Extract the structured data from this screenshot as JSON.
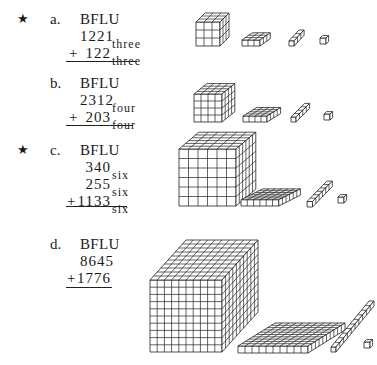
{
  "problems": [
    {
      "id": "a",
      "starred": true,
      "label": "a.",
      "title": "BFLU",
      "lines": [
        {
          "op": "",
          "value": "1221",
          "base": "three"
        },
        {
          "op": "+",
          "value": "122",
          "base": "three"
        }
      ],
      "blocks": {
        "base": 3
      }
    },
    {
      "id": "b",
      "starred": false,
      "label": "b.",
      "title": "BFLU",
      "lines": [
        {
          "op": "",
          "value": "2312",
          "base": "four"
        },
        {
          "op": "+",
          "value": "203",
          "base": "four"
        }
      ],
      "blocks": {
        "base": 4
      }
    },
    {
      "id": "c",
      "starred": true,
      "label": "c.",
      "title": "BFLU",
      "lines": [
        {
          "op": "",
          "value": "340",
          "base": "six"
        },
        {
          "op": "",
          "value": "255",
          "base": "six"
        },
        {
          "op": "+",
          "value": "1133",
          "base": "six"
        }
      ],
      "blocks": {
        "base": 6
      }
    },
    {
      "id": "d",
      "starred": false,
      "label": "d.",
      "title": "BFLU",
      "lines": [
        {
          "op": "",
          "value": "8645",
          "base": ""
        },
        {
          "op": "+",
          "value": "1776",
          "base": ""
        }
      ],
      "blocks": {
        "base": 10
      }
    }
  ],
  "star_symbol": "★",
  "block_names": [
    "block",
    "flat",
    "long",
    "unit"
  ],
  "line_color": "#222222"
}
